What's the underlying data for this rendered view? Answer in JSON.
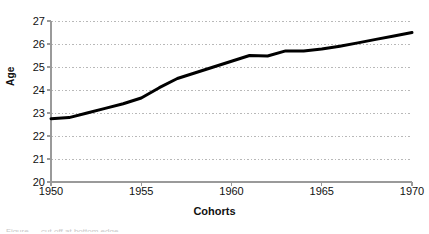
{
  "chart_data": {
    "type": "line",
    "title": "",
    "xlabel": "Cohorts",
    "ylabel": "Age",
    "xlim": [
      1950,
      1970
    ],
    "ylim": [
      20,
      27
    ],
    "grid": true,
    "grid_axis": "y",
    "legend": "none",
    "x_ticks": [
      1950,
      1955,
      1960,
      1965,
      1970
    ],
    "y_ticks": [
      20,
      21,
      22,
      23,
      24,
      25,
      26,
      27
    ],
    "line_color": "#000000",
    "line_width": 3,
    "x": [
      1950,
      1951,
      1952,
      1953,
      1954,
      1955,
      1956,
      1957,
      1958,
      1959,
      1960,
      1961,
      1962,
      1963,
      1964,
      1965,
      1966,
      1967,
      1968,
      1969,
      1970
    ],
    "values": [
      22.75,
      22.8,
      23.0,
      23.2,
      23.4,
      23.65,
      24.1,
      24.5,
      24.75,
      25.0,
      25.25,
      25.5,
      25.48,
      25.7,
      25.7,
      25.78,
      25.9,
      26.05,
      26.2,
      26.35,
      26.5
    ],
    "series": [
      {
        "name": "Mean age",
        "values": [
          22.75,
          22.8,
          23.0,
          23.2,
          23.4,
          23.65,
          24.1,
          24.5,
          24.75,
          25.0,
          25.25,
          25.5,
          25.48,
          25.7,
          25.7,
          25.78,
          25.9,
          26.05,
          26.2,
          26.35,
          26.5
        ]
      }
    ]
  },
  "axes": {
    "y_title": "Age",
    "x_title": "Cohorts",
    "y_tick_labels": [
      "27",
      "26",
      "25",
      "24",
      "23",
      "22",
      "21",
      "20"
    ],
    "x_tick_labels": [
      "1950",
      "1955",
      "1960",
      "1965",
      "1970"
    ]
  },
  "caption": {
    "partial_text": "Figure — cut off at bottom edge"
  },
  "colors": {
    "line": "#000000",
    "grid": "#b8b8b8",
    "axis": "#9a9a9a",
    "text": "#111111",
    "background": "#ffffff"
  }
}
